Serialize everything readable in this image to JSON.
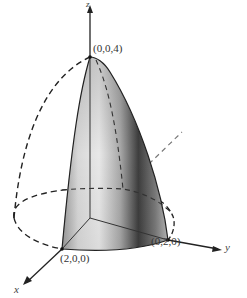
{
  "figure": {
    "points": {
      "apex": "(0,0,4)",
      "x_intercept": "(2,0,0)",
      "y_intercept": "(0,2,0)"
    },
    "axes": {
      "x": "x",
      "y": "y",
      "z": "z"
    },
    "colors": {
      "stroke": "#222222",
      "surface_light": "#e6e6e6",
      "surface_mid": "#b5b5b5",
      "surface_dark": "#4a4a4a",
      "background": "#ffffff"
    }
  }
}
